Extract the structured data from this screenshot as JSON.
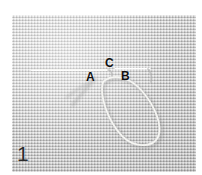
{
  "figure": {
    "caption_number": "1",
    "alt_description": "Close-up photograph of light grey woven embroidery fabric with a pale thread passing through it, forming a long loop; three stitch positions are labelled."
  },
  "photo": {
    "fabric_color": "#cfcfcf",
    "fabric_highlight": "#dcdcdc",
    "fabric_shadow": "#bdbdbd",
    "thread_color": "#f4f4f0",
    "thread_shadow_color": "#9a9a9a",
    "border_color": "#ffffff"
  },
  "markers": [
    {
      "id": "a",
      "label": "A",
      "x": 86,
      "y": 71
    },
    {
      "id": "b",
      "label": "B",
      "x": 121,
      "y": 70
    },
    {
      "id": "c",
      "label": "C",
      "x": 105,
      "y": 57
    }
  ],
  "step": {
    "number": "1"
  }
}
